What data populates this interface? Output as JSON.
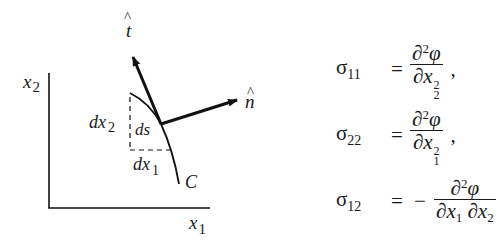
{
  "figure": {
    "axes": {
      "x_label": "x",
      "x_label_sub": "1",
      "y_label": "x",
      "y_label_sub": "2"
    },
    "curve_label": "C",
    "tangent_vector_label": "t",
    "normal_vector_label": "n",
    "hat_symbol": "^",
    "dx2_label": "dx",
    "dx2_sub": "2",
    "ds_label": "ds",
    "dx1_label": "dx",
    "dx1_sub": "1"
  },
  "equations": [
    {
      "lhs_symbol": "σ",
      "lhs_sub": "11",
      "equals": "=",
      "sign": "",
      "numerator": "∂",
      "numerator_sup": "2",
      "numerator_var": "φ",
      "denominator": "∂x",
      "denominator_sup": "2",
      "denominator_sub": "2",
      "trailing": ","
    },
    {
      "lhs_symbol": "σ",
      "lhs_sub": "22",
      "equals": "=",
      "sign": "",
      "numerator": "∂",
      "numerator_sup": "2",
      "numerator_var": "φ",
      "denominator": "∂x",
      "denominator_sup": "2",
      "denominator_sub": "1",
      "trailing": ","
    },
    {
      "lhs_symbol": "σ",
      "lhs_sub": "12",
      "equals": "=",
      "sign": "−",
      "numerator": "∂",
      "numerator_sup": "2",
      "numerator_var": "φ",
      "denominator_part1": "∂x",
      "denominator_part1_sub": "1",
      "denominator_part2": "∂x",
      "denominator_part2_sub": "2",
      "trailing": ""
    }
  ]
}
